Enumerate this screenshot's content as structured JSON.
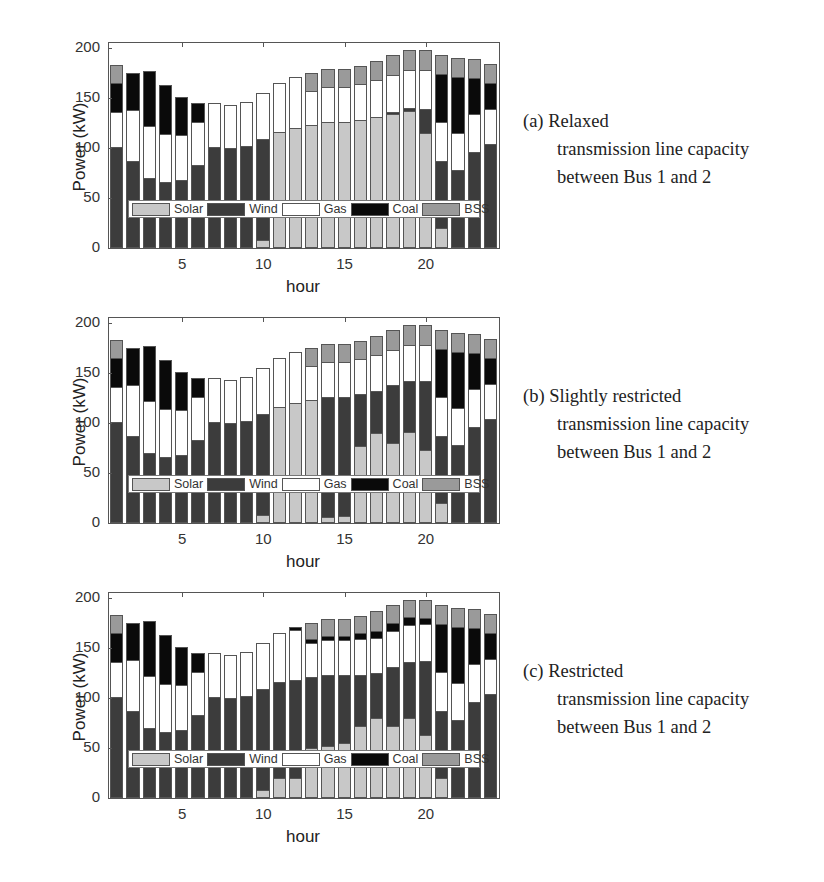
{
  "figure": {
    "panels": [
      {
        "caption_line1": "(a) Relaxed",
        "caption_line2": "transmission line capacity",
        "caption_line3": "between Bus 1 and 2"
      },
      {
        "caption_line1": "(b) Slightly restricted",
        "caption_line2": "transmission line capacity",
        "caption_line3": "between Bus 1 and 2"
      },
      {
        "caption_line1": "(c) Restricted",
        "caption_line2": "transmission line capacity",
        "caption_line3": "between Bus 1 and 2"
      }
    ]
  },
  "colors": {
    "Solar": "#c8c8c8",
    "Wind": "#3c3c3c",
    "Gas": "#ffffff",
    "Coal": "#0a0a0a",
    "BSS": "#9a9a9a"
  },
  "chart_data": [
    {
      "type": "bar",
      "stacked": true,
      "title": "(a) Relaxed transmission line capacity between Bus 1 and 2",
      "xlabel": "hour",
      "ylabel": "Power (kW)",
      "ylim": [
        0,
        205
      ],
      "yticks": [
        0,
        50,
        100,
        150,
        200
      ],
      "xticks": [
        5,
        10,
        15,
        20
      ],
      "legend": [
        "Solar",
        "Wind",
        "Gas",
        "Coal",
        "BSS"
      ],
      "legend_position": "inside-bottom",
      "grid": false,
      "categories": [
        1,
        2,
        3,
        4,
        5,
        6,
        7,
        8,
        9,
        10,
        11,
        12,
        13,
        14,
        15,
        16,
        17,
        18,
        19,
        20,
        21,
        22,
        23,
        24
      ],
      "series": [
        {
          "name": "Solar",
          "values": [
            0,
            0,
            0,
            0,
            0,
            0,
            0,
            0,
            0,
            8,
            116,
            120,
            123,
            126,
            126,
            128,
            131,
            134,
            137,
            115,
            20,
            0,
            0,
            0
          ]
        },
        {
          "name": "Wind",
          "values": [
            101,
            87,
            70,
            66,
            68,
            83,
            101,
            100,
            102,
            101,
            0,
            0,
            0,
            0,
            0,
            0,
            0,
            2,
            3,
            24,
            67,
            78,
            96,
            104
          ]
        },
        {
          "name": "Gas",
          "values": [
            35,
            51,
            52,
            48,
            45,
            43,
            44,
            43,
            44,
            46,
            49,
            51,
            34,
            35,
            35,
            36,
            37,
            37,
            38,
            39,
            39,
            37,
            38,
            35
          ]
        },
        {
          "name": "Coal",
          "values": [
            29,
            37,
            55,
            49,
            38,
            19,
            0,
            0,
            0,
            0,
            0,
            0,
            0,
            0,
            0,
            0,
            0,
            0,
            0,
            0,
            48,
            56,
            36,
            26
          ]
        },
        {
          "name": "BSS",
          "values": [
            18,
            0,
            0,
            0,
            0,
            0,
            0,
            0,
            0,
            0,
            0,
            0,
            18,
            18,
            18,
            18,
            19,
            20,
            20,
            20,
            19,
            19,
            19,
            19
          ]
        }
      ]
    },
    {
      "type": "bar",
      "stacked": true,
      "title": "(b) Slightly restricted transmission line capacity between Bus 1 and 2",
      "xlabel": "hour",
      "ylabel": "Power (kW)",
      "ylim": [
        0,
        205
      ],
      "yticks": [
        0,
        50,
        100,
        150,
        200
      ],
      "xticks": [
        5,
        10,
        15,
        20
      ],
      "legend": [
        "Solar",
        "Wind",
        "Gas",
        "Coal",
        "BSS"
      ],
      "legend_position": "inside-bottom",
      "grid": false,
      "categories": [
        1,
        2,
        3,
        4,
        5,
        6,
        7,
        8,
        9,
        10,
        11,
        12,
        13,
        14,
        15,
        16,
        17,
        18,
        19,
        20,
        21,
        22,
        23,
        24
      ],
      "series": [
        {
          "name": "Solar",
          "values": [
            0,
            0,
            0,
            0,
            0,
            0,
            0,
            0,
            0,
            8,
            116,
            120,
            123,
            6,
            7,
            77,
            90,
            80,
            91,
            73,
            20,
            0,
            0,
            0
          ]
        },
        {
          "name": "Wind",
          "values": [
            101,
            87,
            70,
            66,
            68,
            83,
            101,
            100,
            102,
            101,
            0,
            0,
            0,
            120,
            119,
            52,
            42,
            58,
            51,
            69,
            67,
            78,
            96,
            104
          ]
        },
        {
          "name": "Gas",
          "values": [
            35,
            51,
            52,
            48,
            45,
            43,
            44,
            43,
            44,
            46,
            49,
            51,
            34,
            35,
            35,
            35,
            36,
            35,
            36,
            36,
            39,
            37,
            38,
            35
          ]
        },
        {
          "name": "Coal",
          "values": [
            29,
            37,
            55,
            49,
            38,
            19,
            0,
            0,
            0,
            0,
            0,
            0,
            0,
            0,
            0,
            0,
            0,
            0,
            0,
            0,
            48,
            56,
            36,
            26
          ]
        },
        {
          "name": "BSS",
          "values": [
            18,
            0,
            0,
            0,
            0,
            0,
            0,
            0,
            0,
            0,
            0,
            0,
            18,
            18,
            18,
            18,
            19,
            20,
            20,
            20,
            19,
            19,
            19,
            19
          ]
        }
      ]
    },
    {
      "type": "bar",
      "stacked": true,
      "title": "(c) Restricted transmission line capacity between Bus 1 and 2",
      "xlabel": "hour",
      "ylabel": "Power (kW)",
      "ylim": [
        0,
        205
      ],
      "yticks": [
        0,
        50,
        100,
        150,
        200
      ],
      "xticks": [
        5,
        10,
        15,
        20
      ],
      "legend": [
        "Solar",
        "Wind",
        "Gas",
        "Coal",
        "BSS"
      ],
      "legend_position": "inside-bottom",
      "grid": false,
      "categories": [
        1,
        2,
        3,
        4,
        5,
        6,
        7,
        8,
        9,
        10,
        11,
        12,
        13,
        14,
        15,
        16,
        17,
        18,
        19,
        20,
        21,
        22,
        23,
        24
      ],
      "series": [
        {
          "name": "Solar",
          "values": [
            0,
            0,
            0,
            0,
            0,
            0,
            0,
            0,
            0,
            8,
            20,
            20,
            50,
            52,
            55,
            72,
            80,
            72,
            80,
            63,
            20,
            0,
            0,
            0
          ]
        },
        {
          "name": "Wind",
          "values": [
            101,
            87,
            70,
            66,
            68,
            83,
            101,
            100,
            102,
            101,
            96,
            98,
            71,
            71,
            68,
            51,
            45,
            59,
            56,
            74,
            67,
            78,
            96,
            104
          ]
        },
        {
          "name": "Gas",
          "values": [
            35,
            51,
            52,
            48,
            45,
            43,
            44,
            43,
            44,
            46,
            49,
            50,
            34,
            35,
            35,
            36,
            35,
            36,
            37,
            37,
            39,
            37,
            38,
            35
          ]
        },
        {
          "name": "Coal",
          "values": [
            29,
            37,
            55,
            49,
            38,
            19,
            0,
            0,
            0,
            0,
            0,
            3,
            4,
            4,
            4,
            6,
            7,
            8,
            8,
            6,
            48,
            56,
            36,
            26
          ]
        },
        {
          "name": "BSS",
          "values": [
            18,
            0,
            0,
            0,
            0,
            0,
            0,
            0,
            0,
            0,
            0,
            0,
            16,
            17,
            17,
            17,
            20,
            18,
            17,
            18,
            19,
            19,
            19,
            19
          ]
        }
      ]
    }
  ]
}
